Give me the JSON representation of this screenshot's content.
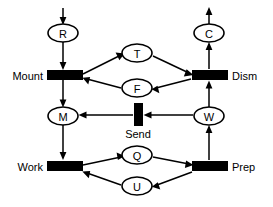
{
  "diagram": {
    "type": "petri-net",
    "canvas": {
      "width": 273,
      "height": 207,
      "background": "#ffffff"
    },
    "ink_color": "#000000",
    "places": [
      {
        "id": "R",
        "label": "R",
        "cx": 63,
        "cy": 33,
        "rx": 15,
        "ry": 9
      },
      {
        "id": "C",
        "label": "C",
        "cx": 209,
        "cy": 33,
        "rx": 15,
        "ry": 9
      },
      {
        "id": "T",
        "label": "T",
        "cx": 137,
        "cy": 53,
        "rx": 15,
        "ry": 9
      },
      {
        "id": "F",
        "label": "F",
        "cx": 137,
        "cy": 88,
        "rx": 15,
        "ry": 9
      },
      {
        "id": "M",
        "label": "M",
        "cx": 63,
        "cy": 116,
        "rx": 15,
        "ry": 9
      },
      {
        "id": "W",
        "label": "W",
        "cx": 209,
        "cy": 116,
        "rx": 15,
        "ry": 9
      },
      {
        "id": "Q",
        "label": "Q",
        "cx": 137,
        "cy": 155,
        "rx": 15,
        "ry": 9
      },
      {
        "id": "U",
        "label": "U",
        "cx": 137,
        "cy": 186,
        "rx": 15,
        "ry": 9
      }
    ],
    "transitions": [
      {
        "id": "mount",
        "label": "Mount",
        "x": 47,
        "y": 70,
        "w": 36,
        "h": 10,
        "orient": "horizontal",
        "label_side": "left",
        "label_x": 43,
        "label_y": 75
      },
      {
        "id": "dism",
        "label": "Dism",
        "x": 192,
        "y": 70,
        "w": 36,
        "h": 10,
        "orient": "horizontal",
        "label_side": "right",
        "label_x": 232,
        "label_y": 75
      },
      {
        "id": "send",
        "label": "Send",
        "x": 134,
        "y": 103,
        "w": 9,
        "h": 23,
        "orient": "vertical",
        "label_side": "bottom",
        "label_x": 138,
        "label_y": 134
      },
      {
        "id": "work",
        "label": "Work",
        "x": 47,
        "y": 161,
        "w": 36,
        "h": 10,
        "orient": "horizontal",
        "label_side": "left",
        "label_x": 43,
        "label_y": 166
      },
      {
        "id": "prep",
        "label": "Prep",
        "x": 192,
        "y": 161,
        "w": 36,
        "h": 10,
        "orient": "horizontal",
        "label_side": "right",
        "label_x": 232,
        "label_y": 166
      }
    ],
    "arcs": [
      {
        "id": "in-to-R",
        "from": "input",
        "to": "R",
        "path": "M 63,8 L 63,23",
        "head": "63,25 59.6,17 66.4,17"
      },
      {
        "id": "R-to-mount",
        "from": "R",
        "to": "mount",
        "path": "M 63,42 L 63,67",
        "head": "63,70 59.6,62 66.4,62"
      },
      {
        "id": "mount-to-T",
        "from": "mount",
        "to": "T",
        "path": "M 83,74 L 120,56",
        "head": "124.5,53.8 115.9,53.2 119.2,59.9"
      },
      {
        "id": "T-to-dism",
        "from": "T",
        "to": "dism",
        "path": "M 153,56 L 189,73",
        "head": "193.5,75.2 187.0,69.4 184.0,76.2"
      },
      {
        "id": "dism-to-F",
        "from": "dism",
        "to": "F",
        "path": "M 191,78 L 155,88",
        "head": "150.5,89.3 158.2,93.1 156.4,86.0"
      },
      {
        "id": "F-to-mount",
        "from": "F",
        "to": "mount",
        "path": "M 121,88 L 86,79",
        "head": "81.5,77.8 87.0,84.4 88.7,77.3"
      },
      {
        "id": "mount-to-M",
        "from": "mount",
        "to": "M",
        "path": "M 63,80 L 63,104",
        "head": "63,107 59.6,99 66.4,99"
      },
      {
        "id": "M-to-work",
        "from": "M",
        "to": "work",
        "path": "M 63,125 L 63,157",
        "head": "63,160 59.6,152 66.4,152"
      },
      {
        "id": "send-to-M",
        "from": "send",
        "to": "M",
        "path": "M 133,115 L 82,115",
        "head": "78.5,115 86.5,111.6 86.5,118.4"
      },
      {
        "id": "W-to-send",
        "from": "W",
        "to": "send",
        "path": "M 193,115 L 147,115",
        "head": "143.5,115 151.5,111.6 151.5,118.4"
      },
      {
        "id": "prep-to-W",
        "from": "prep",
        "to": "W",
        "path": "M 209,160 L 209,128",
        "head": "209,125 205.6,133 212.4,133"
      },
      {
        "id": "W-to-dism",
        "from": "W",
        "to": "dism",
        "path": "M 209,107 L 209,83",
        "head": "209,80 205.6,88 212.4,88"
      },
      {
        "id": "dism-to-C",
        "from": "dism",
        "to": "C",
        "path": "M 209,69 L 209,45",
        "head": "209,42 205.6,50 212.4,50"
      },
      {
        "id": "C-to-out",
        "from": "C",
        "to": "output",
        "path": "M 209,24 L 209,11",
        "head": "209,7 205.6,15 212.4,15"
      },
      {
        "id": "work-to-Q",
        "from": "work",
        "to": "Q",
        "path": "M 83,165 L 120,157",
        "head": "124.5,156 116.4,152.8 117.6,159.6"
      },
      {
        "id": "Q-to-prep",
        "from": "Q",
        "to": "prep",
        "path": "M 153,157 L 189,164",
        "head": "193.5,165 186.3,160.4 185.0,167.2"
      },
      {
        "id": "prep-to-U",
        "from": "prep",
        "to": "U",
        "path": "M 192,172 L 156,185",
        "head": "151.5,186.6 159.7,189.5 157.4,182.9"
      },
      {
        "id": "U-to-work",
        "from": "U",
        "to": "work",
        "path": "M 121,185 L 86,173",
        "head": "81.5,171.5 87.8,177.7 88.9,170.8"
      }
    ]
  }
}
